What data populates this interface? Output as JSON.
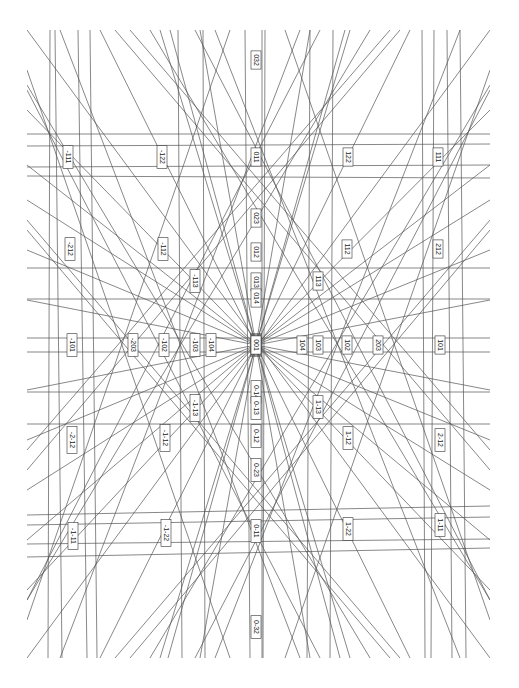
{
  "diagram": {
    "frame": {
      "x0": 27,
      "y0": 30,
      "x1": 490,
      "y1": 658
    },
    "center": {
      "x": 256,
      "y": 345
    },
    "labels": [
      {
        "text": "032",
        "x": 256,
        "y": 60
      },
      {
        "text": "-111",
        "x": 68,
        "y": 157
      },
      {
        "text": "-122",
        "x": 162,
        "y": 157
      },
      {
        "text": "011",
        "x": 256,
        "y": 157
      },
      {
        "text": "122",
        "x": 348,
        "y": 157
      },
      {
        "text": "111",
        "x": 438,
        "y": 157
      },
      {
        "text": "023",
        "x": 256,
        "y": 218
      },
      {
        "text": "-212",
        "x": 70,
        "y": 249
      },
      {
        "text": "-112",
        "x": 163,
        "y": 249
      },
      {
        "text": "012",
        "x": 256,
        "y": 252
      },
      {
        "text": "112",
        "x": 347,
        "y": 249
      },
      {
        "text": "212",
        "x": 438,
        "y": 249
      },
      {
        "text": "-113",
        "x": 195,
        "y": 281
      },
      {
        "text": "013",
        "x": 256,
        "y": 282
      },
      {
        "text": "113",
        "x": 318,
        "y": 281
      },
      {
        "text": "014",
        "x": 256,
        "y": 298
      },
      {
        "text": "-101",
        "x": 72,
        "y": 345
      },
      {
        "text": "-203",
        "x": 133,
        "y": 345
      },
      {
        "text": "-102",
        "x": 164,
        "y": 345
      },
      {
        "text": "-103",
        "x": 195,
        "y": 345
      },
      {
        "text": "-104",
        "x": 211,
        "y": 345
      },
      {
        "text": "001",
        "x": 256,
        "y": 345
      },
      {
        "text": "104",
        "x": 302,
        "y": 345
      },
      {
        "text": "103",
        "x": 318,
        "y": 345
      },
      {
        "text": "102",
        "x": 347,
        "y": 345
      },
      {
        "text": "203",
        "x": 378,
        "y": 345
      },
      {
        "text": "101",
        "x": 440,
        "y": 345
      },
      {
        "text": "0-14",
        "x": 256,
        "y": 392
      },
      {
        "text": "0-13",
        "x": 256,
        "y": 408
      },
      {
        "text": "1-13",
        "x": 318,
        "y": 407
      },
      {
        "text": "-1-13",
        "x": 195,
        "y": 408
      },
      {
        "text": "-2-12",
        "x": 72,
        "y": 440
      },
      {
        "text": "-1-12",
        "x": 165,
        "y": 438
      },
      {
        "text": "0-12",
        "x": 256,
        "y": 436
      },
      {
        "text": "1-12",
        "x": 348,
        "y": 438
      },
      {
        "text": "2-12",
        "x": 440,
        "y": 440
      },
      {
        "text": "0-23",
        "x": 256,
        "y": 470
      },
      {
        "text": "-1-11",
        "x": 73,
        "y": 536
      },
      {
        "text": "-1-22",
        "x": 166,
        "y": 533
      },
      {
        "text": "0-11",
        "x": 256,
        "y": 531
      },
      {
        "text": "1-22",
        "x": 348,
        "y": 529
      },
      {
        "text": "1-11",
        "x": 440,
        "y": 525
      },
      {
        "text": "0-32",
        "x": 256,
        "y": 627
      }
    ],
    "lines": [
      [
        27,
        134,
        490,
        134
      ],
      [
        27,
        146,
        490,
        144
      ],
      [
        27,
        167,
        490,
        165
      ],
      [
        27,
        176,
        490,
        178
      ],
      [
        27,
        268,
        490,
        268
      ],
      [
        27,
        299,
        490,
        299
      ],
      [
        27,
        338,
        490,
        338
      ],
      [
        27,
        352,
        490,
        352
      ],
      [
        27,
        392,
        490,
        392
      ],
      [
        27,
        424,
        490,
        424
      ],
      [
        27,
        515,
        490,
        506
      ],
      [
        27,
        525,
        490,
        517
      ],
      [
        27,
        544,
        490,
        539
      ],
      [
        27,
        557,
        490,
        548
      ],
      [
        50,
        30,
        48,
        658
      ],
      [
        55,
        30,
        62,
        658
      ],
      [
        78,
        30,
        87,
        658
      ],
      [
        90,
        30,
        97,
        658
      ],
      [
        245,
        30,
        250,
        658
      ],
      [
        262,
        30,
        262,
        658
      ],
      [
        265,
        30,
        263,
        658
      ],
      [
        422,
        30,
        425,
        658
      ],
      [
        434,
        30,
        431,
        658
      ],
      [
        447,
        30,
        452,
        658
      ],
      [
        460,
        30,
        466,
        658
      ],
      [
        178,
        30,
        182,
        658
      ],
      [
        203,
        30,
        205,
        658
      ],
      [
        310,
        30,
        307,
        658
      ],
      [
        333,
        30,
        330,
        658
      ],
      [
        27,
        30,
        490,
        658
      ],
      [
        490,
        30,
        27,
        658
      ],
      [
        27,
        110,
        256,
        345
      ],
      [
        27,
        165,
        256,
        345
      ],
      [
        27,
        200,
        256,
        345
      ],
      [
        27,
        250,
        256,
        345
      ],
      [
        27,
        300,
        256,
        345
      ],
      [
        27,
        390,
        256,
        345
      ],
      [
        27,
        440,
        256,
        345
      ],
      [
        27,
        490,
        256,
        345
      ],
      [
        27,
        540,
        256,
        345
      ],
      [
        27,
        590,
        256,
        345
      ],
      [
        490,
        110,
        256,
        345
      ],
      [
        490,
        165,
        256,
        345
      ],
      [
        490,
        200,
        256,
        345
      ],
      [
        490,
        250,
        256,
        345
      ],
      [
        490,
        300,
        256,
        345
      ],
      [
        490,
        390,
        256,
        345
      ],
      [
        490,
        440,
        256,
        345
      ],
      [
        490,
        490,
        256,
        345
      ],
      [
        490,
        540,
        256,
        345
      ],
      [
        490,
        590,
        256,
        345
      ],
      [
        100,
        30,
        256,
        345
      ],
      [
        160,
        30,
        256,
        345
      ],
      [
        200,
        30,
        256,
        345
      ],
      [
        310,
        30,
        256,
        345
      ],
      [
        350,
        30,
        256,
        345
      ],
      [
        410,
        30,
        256,
        345
      ],
      [
        100,
        658,
        256,
        345
      ],
      [
        160,
        658,
        256,
        345
      ],
      [
        200,
        658,
        256,
        345
      ],
      [
        310,
        658,
        256,
        345
      ],
      [
        350,
        658,
        256,
        345
      ],
      [
        410,
        658,
        256,
        345
      ],
      [
        256,
        345,
        170,
        30
      ],
      [
        256,
        345,
        340,
        658
      ],
      [
        256,
        345,
        345,
        30
      ],
      [
        256,
        345,
        168,
        658
      ],
      [
        130,
        30,
        490,
        450
      ],
      [
        390,
        30,
        27,
        450
      ],
      [
        130,
        658,
        490,
        230
      ],
      [
        390,
        658,
        27,
        230
      ],
      [
        27,
        90,
        320,
        658
      ],
      [
        490,
        90,
        195,
        658
      ],
      [
        27,
        600,
        320,
        30
      ],
      [
        490,
        600,
        195,
        30
      ],
      [
        60,
        30,
        300,
        658
      ],
      [
        460,
        30,
        215,
        658
      ],
      [
        60,
        658,
        300,
        30
      ],
      [
        460,
        658,
        215,
        30
      ],
      [
        27,
        220,
        400,
        658
      ],
      [
        490,
        220,
        115,
        658
      ],
      [
        27,
        470,
        400,
        30
      ],
      [
        490,
        470,
        115,
        30
      ],
      [
        150,
        30,
        490,
        600
      ],
      [
        370,
        30,
        27,
        600
      ],
      [
        150,
        658,
        490,
        85
      ],
      [
        370,
        658,
        27,
        85
      ],
      [
        27,
        70,
        230,
        658
      ],
      [
        490,
        70,
        285,
        658
      ],
      [
        27,
        620,
        230,
        30
      ],
      [
        490,
        620,
        285,
        30
      ]
    ],
    "stroke_color": "#555555",
    "label_border_color": "#333333"
  }
}
